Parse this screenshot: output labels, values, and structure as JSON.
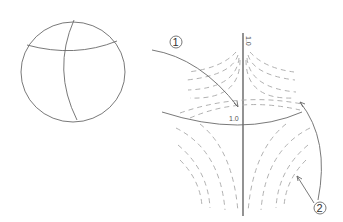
{
  "figure": {
    "sphere": {
      "label": "sphere-with-intersecting-curves"
    },
    "axis_label_top": "1.0",
    "axis_label_mid": "1.0",
    "callouts": [
      {
        "id": "1",
        "text": "1"
      },
      {
        "id": "2",
        "text": "2"
      }
    ],
    "colors": {
      "line": "#6a6a6a",
      "axis": "#3a3a3a",
      "dashed": "#a8a8a8"
    }
  }
}
